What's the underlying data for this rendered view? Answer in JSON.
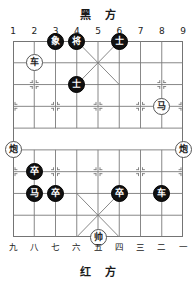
{
  "board": {
    "top_label": "黑 方",
    "bottom_label": "红 方",
    "files_top": [
      "1",
      "2",
      "3",
      "4",
      "5",
      "6",
      "7",
      "8",
      "9"
    ],
    "files_bottom": [
      "九",
      "八",
      "七",
      "六",
      "五",
      "四",
      "三",
      "二",
      "一"
    ],
    "columns": 9,
    "rows": 10,
    "line_color": "#7a7a7a",
    "frame_color": "#6f6f6f",
    "background": "#ffffff"
  },
  "pieces": [
    {
      "name": "black-elephant",
      "label": "象",
      "side": "black",
      "col": 3,
      "row": 1
    },
    {
      "name": "black-general",
      "label": "将",
      "side": "black",
      "col": 4,
      "row": 1
    },
    {
      "name": "black-advisor-1",
      "label": "士",
      "side": "black",
      "col": 6,
      "row": 1
    },
    {
      "name": "red-chariot-1",
      "label": "车",
      "side": "red",
      "col": 2,
      "row": 2
    },
    {
      "name": "black-advisor-2",
      "label": "士",
      "side": "black",
      "col": 4,
      "row": 3
    },
    {
      "name": "red-horse",
      "label": "马",
      "side": "red",
      "col": 8,
      "row": 4
    },
    {
      "name": "red-cannon-left",
      "label": "炮",
      "side": "red",
      "col": 1,
      "row": 6
    },
    {
      "name": "red-cannon-right",
      "label": "炮",
      "side": "red",
      "col": 9,
      "row": 6
    },
    {
      "name": "black-pawn-1",
      "label": "卒",
      "side": "black",
      "col": 2,
      "row": 7
    },
    {
      "name": "black-horse",
      "label": "马",
      "side": "black",
      "col": 2,
      "row": 8
    },
    {
      "name": "black-pawn-2",
      "label": "卒",
      "side": "black",
      "col": 3,
      "row": 8
    },
    {
      "name": "black-pawn-3",
      "label": "卒",
      "side": "black",
      "col": 6,
      "row": 8
    },
    {
      "name": "black-chariot",
      "label": "车",
      "side": "black",
      "col": 8,
      "row": 8
    },
    {
      "name": "red-general",
      "label": "帅",
      "side": "red",
      "col": 5,
      "row": 10
    }
  ]
}
